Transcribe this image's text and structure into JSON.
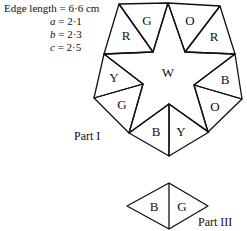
{
  "spec": {
    "edge_length": "Edge length = 6·6 cm",
    "vars": [
      {
        "name": "a",
        "value": "= 2·1"
      },
      {
        "name": "b",
        "value": "= 2·3"
      },
      {
        "name": "c",
        "value": "= 2·5"
      }
    ]
  },
  "part1": {
    "label": "Part I",
    "center_label": "W",
    "triangles": [
      {
        "label": "R",
        "points": "119,4 104,54 153,52",
        "lx": 126,
        "ly": 35
      },
      {
        "label": "G",
        "points": "119,4 168,3 153,52",
        "lx": 147,
        "ly": 20
      },
      {
        "label": "O",
        "points": "168,3 220,6 185,52",
        "lx": 190,
        "ly": 20
      },
      {
        "label": "R",
        "points": "220,6 235,54 185,52",
        "lx": 214,
        "ly": 36
      },
      {
        "label": "B",
        "points": "235,54 242,99 194,85",
        "lx": 225,
        "ly": 79
      },
      {
        "label": "O",
        "points": "242,99 208,132 194,85",
        "lx": 215,
        "ly": 106
      },
      {
        "label": "Y",
        "points": "169,104 209,132 169,156",
        "lx": 181,
        "ly": 131
      },
      {
        "label": "B",
        "points": "169,104 129,133 169,156",
        "lx": 156,
        "ly": 131
      },
      {
        "label": "G",
        "points": "94,98 143,84 129,133",
        "lx": 122,
        "ly": 104
      },
      {
        "label": "Y",
        "points": "104,54 94,98 143,84",
        "lx": 114,
        "ly": 77
      }
    ],
    "star_points": "168,3 185,52 235,54 194,85 208,132 169,104 129,133 143,84 104,54 153,52"
  },
  "part3": {
    "label": "Part III",
    "left_label": "B",
    "right_label": "G"
  }
}
